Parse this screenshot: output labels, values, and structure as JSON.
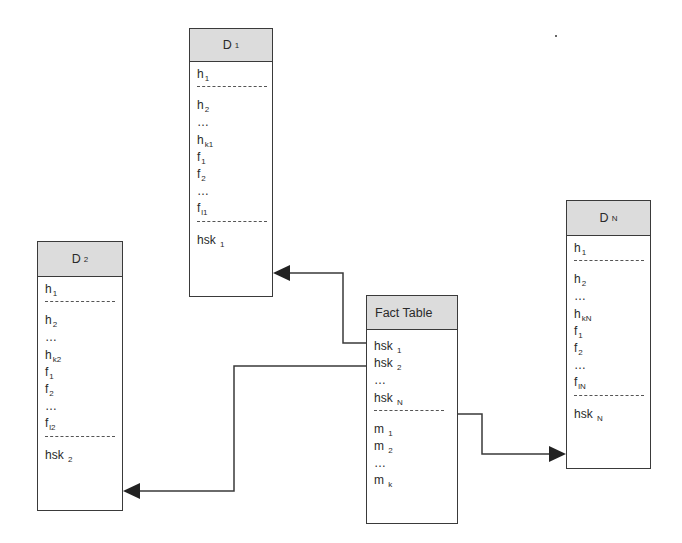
{
  "diagram": {
    "type": "star-schema",
    "tables": {
      "d1": {
        "title": "D",
        "title_sub": "1",
        "rows": [
          {
            "t": "h",
            "s": "1"
          },
          {
            "sep": true
          },
          {
            "t": "h",
            "s": "2"
          },
          {
            "t": "…",
            "s": ""
          },
          {
            "t": "h",
            "s": "k1"
          },
          {
            "t": "f",
            "s": "1"
          },
          {
            "t": "f",
            "s": "2"
          },
          {
            "t": "…",
            "s": ""
          },
          {
            "t": "f",
            "s": "l1"
          },
          {
            "sep": true
          },
          {
            "t": "hsk ",
            "s": "1"
          }
        ]
      },
      "d2": {
        "title": "D",
        "title_sub": "2",
        "rows": [
          {
            "t": "h",
            "s": "1"
          },
          {
            "sep": true
          },
          {
            "t": "h",
            "s": "2"
          },
          {
            "t": "…",
            "s": ""
          },
          {
            "t": "h",
            "s": "k2"
          },
          {
            "t": "f",
            "s": "1"
          },
          {
            "t": "f",
            "s": "2"
          },
          {
            "t": "…",
            "s": ""
          },
          {
            "t": "f",
            "s": "l2"
          },
          {
            "sep": true
          },
          {
            "t": "hsk ",
            "s": "2"
          }
        ]
      },
      "dn": {
        "title": "D",
        "title_sub": "N",
        "rows": [
          {
            "t": "h",
            "s": "1"
          },
          {
            "sep": true
          },
          {
            "t": "h",
            "s": "2"
          },
          {
            "t": "…",
            "s": ""
          },
          {
            "t": "h",
            "s": "kN"
          },
          {
            "t": "f",
            "s": "1"
          },
          {
            "t": "f",
            "s": "2"
          },
          {
            "t": "…",
            "s": ""
          },
          {
            "t": "f",
            "s": "lN"
          },
          {
            "sep": true
          },
          {
            "t": "hsk ",
            "s": "N"
          }
        ]
      },
      "fact": {
        "title": "Fact Table",
        "title_sub": "",
        "rows": [
          {
            "t": "hsk ",
            "s": "1"
          },
          {
            "t": "hsk ",
            "s": "2"
          },
          {
            "t": "…",
            "s": ""
          },
          {
            "t": "hsk ",
            "s": "N"
          },
          {
            "sep": true
          },
          {
            "t": "m ",
            "s": "1"
          },
          {
            "t": "m ",
            "s": "2"
          },
          {
            "t": "…",
            "s": ""
          },
          {
            "t": "m ",
            "s": "k"
          }
        ]
      }
    },
    "connections": [
      {
        "from": "fact.hsk_1",
        "to": "d1.hsk_1"
      },
      {
        "from": "fact.hsk_2",
        "to": "d2.hsk_2"
      },
      {
        "from": "fact.hsk_N",
        "to": "dn.hsk_N"
      }
    ],
    "colors": {
      "header_fill": "#dcdcdc",
      "stroke": "#3a3a3a",
      "background": "#ffffff"
    }
  }
}
